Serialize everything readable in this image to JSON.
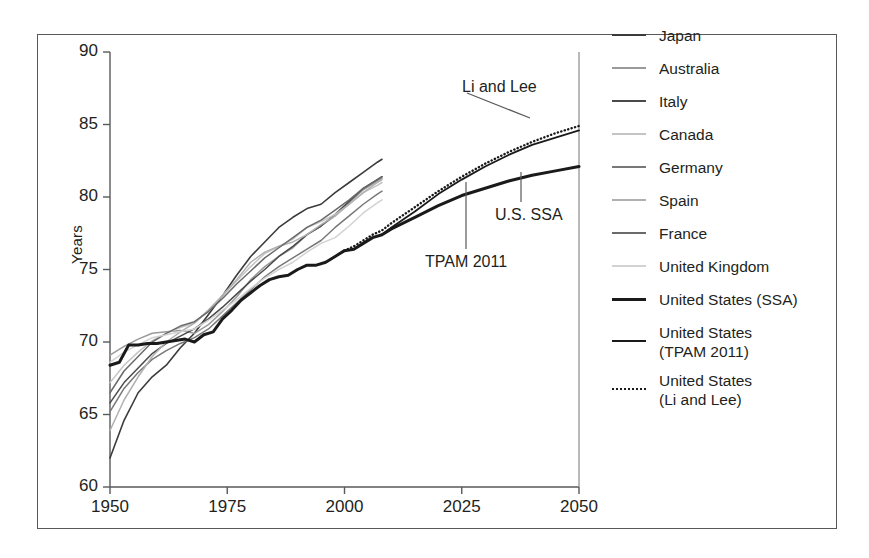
{
  "chart_data": {
    "type": "line",
    "title": "",
    "xlabel": "",
    "ylabel": "Years",
    "xlim": [
      1950,
      2050
    ],
    "ylim": [
      60,
      90
    ],
    "xticks": [
      1950,
      1975,
      2000,
      2025,
      2050
    ],
    "yticks": [
      60,
      65,
      70,
      75,
      80,
      85,
      90
    ],
    "grid": false,
    "legend_position": "right",
    "annotations": [
      {
        "text": "Li and Lee",
        "x": 2033,
        "y": 87.4
      },
      {
        "text": "TPAM 2011",
        "x": 2022,
        "y": 73.2
      },
      {
        "text": "U.S. SSA",
        "x": 2037,
        "y": 77.0
      }
    ],
    "series": [
      {
        "name": "Japan",
        "color": "#3b3b3b",
        "width": 1.6,
        "dash": "none",
        "x": [
          1950,
          1953,
          1956,
          1959,
          1962,
          1965,
          1968,
          1971,
          1974,
          1977,
          1980,
          1983,
          1986,
          1989,
          1992,
          1995,
          1998,
          2001,
          2004,
          2007,
          2008
        ],
        "values": [
          62.0,
          64.6,
          66.5,
          67.6,
          68.4,
          69.6,
          70.6,
          71.9,
          73.2,
          74.6,
          75.9,
          76.9,
          77.9,
          78.6,
          79.2,
          79.5,
          80.3,
          81.0,
          81.7,
          82.4,
          82.6
        ]
      },
      {
        "name": "Australia",
        "color": "#9a9a9a",
        "width": 1.5,
        "dash": "none",
        "x": [
          1950,
          1953,
          1956,
          1959,
          1962,
          1965,
          1968,
          1971,
          1974,
          1977,
          1980,
          1983,
          1986,
          1989,
          1992,
          1995,
          1998,
          2001,
          2004,
          2007,
          2008
        ],
        "values": [
          69.1,
          69.7,
          70.2,
          70.6,
          70.7,
          70.8,
          70.6,
          71.2,
          72.1,
          73.1,
          74.3,
          75.2,
          75.9,
          76.5,
          77.4,
          78.0,
          78.7,
          79.6,
          80.5,
          81.1,
          81.3
        ]
      },
      {
        "name": "Italy",
        "color": "#4a4a4a",
        "width": 1.5,
        "dash": "none",
        "x": [
          1950,
          1953,
          1956,
          1959,
          1962,
          1965,
          1968,
          1971,
          1974,
          1977,
          1980,
          1983,
          1986,
          1989,
          1992,
          1995,
          1998,
          2001,
          2004,
          2007,
          2008
        ],
        "values": [
          65.8,
          67.2,
          68.2,
          69.2,
          69.9,
          70.4,
          70.9,
          71.6,
          72.4,
          73.3,
          74.2,
          75.0,
          75.9,
          76.6,
          77.4,
          78.0,
          78.8,
          79.7,
          80.6,
          81.2,
          81.4
        ]
      },
      {
        "name": "Canada",
        "color": "#c4c4c4",
        "width": 1.5,
        "dash": "none",
        "x": [
          1950,
          1953,
          1956,
          1959,
          1962,
          1965,
          1968,
          1971,
          1974,
          1977,
          1980,
          1983,
          1986,
          1989,
          1992,
          1995,
          1998,
          2001,
          2004,
          2007,
          2008
        ],
        "values": [
          67.2,
          68.4,
          69.3,
          70.1,
          70.6,
          71.0,
          71.3,
          72.2,
          73.2,
          74.2,
          75.2,
          76.1,
          76.6,
          77.1,
          77.9,
          78.3,
          78.8,
          79.5,
          80.3,
          80.8,
          81.0
        ]
      },
      {
        "name": "Germany",
        "color": "#787878",
        "width": 1.5,
        "dash": "none",
        "x": [
          1950,
          1953,
          1956,
          1959,
          1962,
          1965,
          1968,
          1971,
          1974,
          1977,
          1980,
          1983,
          1986,
          1989,
          1992,
          1995,
          1998,
          2001,
          2004,
          2007,
          2008
        ],
        "values": [
          65.2,
          66.8,
          67.9,
          68.8,
          69.4,
          69.9,
          70.3,
          70.9,
          71.8,
          72.7,
          73.6,
          74.5,
          75.2,
          75.8,
          76.4,
          77.0,
          77.9,
          78.7,
          79.5,
          80.2,
          80.4
        ]
      },
      {
        "name": "Spain",
        "color": "#b0b0b0",
        "width": 1.5,
        "dash": "none",
        "x": [
          1950,
          1953,
          1956,
          1959,
          1962,
          1965,
          1968,
          1971,
          1974,
          1977,
          1980,
          1983,
          1986,
          1989,
          1992,
          1995,
          1998,
          2001,
          2004,
          2007,
          2008
        ],
        "values": [
          63.9,
          66.0,
          67.6,
          69.0,
          70.0,
          70.7,
          71.3,
          72.2,
          73.2,
          74.3,
          75.5,
          76.2,
          76.6,
          76.9,
          77.4,
          78.1,
          78.7,
          79.5,
          80.3,
          81.0,
          81.2
        ]
      },
      {
        "name": "France",
        "color": "#6a6a6a",
        "width": 1.5,
        "dash": "none",
        "x": [
          1950,
          1953,
          1956,
          1959,
          1962,
          1965,
          1968,
          1971,
          1974,
          1977,
          1980,
          1983,
          1986,
          1989,
          1992,
          1995,
          1998,
          2001,
          2004,
          2007,
          2008
        ],
        "values": [
          66.5,
          68.0,
          69.0,
          70.0,
          70.6,
          71.1,
          71.4,
          72.1,
          73.0,
          74.0,
          74.9,
          75.8,
          76.5,
          77.2,
          77.9,
          78.4,
          79.1,
          79.8,
          80.6,
          81.2,
          81.4
        ]
      },
      {
        "name": "United Kingdom",
        "color": "#d2d2d2",
        "width": 1.5,
        "dash": "none",
        "x": [
          1950,
          1953,
          1956,
          1959,
          1962,
          1965,
          1968,
          1971,
          1974,
          1977,
          1980,
          1983,
          1986,
          1989,
          1992,
          1995,
          1998,
          2001,
          2004,
          2007,
          2008
        ],
        "values": [
          68.6,
          69.3,
          69.8,
          70.3,
          70.5,
          70.7,
          70.9,
          71.5,
          72.2,
          72.9,
          73.7,
          74.4,
          75.0,
          75.5,
          76.2,
          76.8,
          77.2,
          78.0,
          78.9,
          79.6,
          79.8
        ]
      },
      {
        "name": "United States (SSA)",
        "color": "#1a1a1a",
        "width": 3.0,
        "dash": "none",
        "x": [
          1950,
          1952,
          1954,
          1956,
          1958,
          1960,
          1962,
          1964,
          1966,
          1968,
          1970,
          1972,
          1974,
          1976,
          1978,
          1980,
          1982,
          1984,
          1986,
          1988,
          1990,
          1992,
          1994,
          1996,
          1998,
          2000,
          2002,
          2004,
          2006,
          2008,
          2010,
          2015,
          2020,
          2025,
          2030,
          2035,
          2040,
          2045,
          2050
        ],
        "values": [
          68.4,
          68.6,
          69.8,
          69.8,
          69.9,
          69.9,
          70.0,
          70.1,
          70.2,
          70.0,
          70.5,
          70.7,
          71.6,
          72.2,
          72.9,
          73.4,
          73.9,
          74.3,
          74.5,
          74.6,
          75.0,
          75.3,
          75.3,
          75.5,
          75.9,
          76.3,
          76.4,
          76.8,
          77.2,
          77.4,
          77.8,
          78.6,
          79.4,
          80.1,
          80.6,
          81.1,
          81.5,
          81.8,
          82.1
        ]
      },
      {
        "name": "United States (TPAM 2011)",
        "color": "#1a1a1a",
        "width": 1.8,
        "dash": "none",
        "x": [
          2008,
          2010,
          2015,
          2020,
          2025,
          2030,
          2035,
          2040,
          2045,
          2050
        ],
        "values": [
          77.4,
          77.9,
          79.0,
          80.2,
          81.2,
          82.1,
          82.9,
          83.6,
          84.1,
          84.6
        ]
      },
      {
        "name": "United States (Li and Lee)",
        "color": "#1a1a1a",
        "width": 2.4,
        "dash": "dotted",
        "x": [
          2000,
          2002,
          2004,
          2006,
          2008,
          2010,
          2015,
          2020,
          2025,
          2030,
          2035,
          2040,
          2045,
          2050
        ],
        "values": [
          76.3,
          76.6,
          77.0,
          77.4,
          77.7,
          78.2,
          79.3,
          80.4,
          81.4,
          82.3,
          83.1,
          83.8,
          84.4,
          84.9
        ]
      }
    ]
  },
  "axes": {
    "y_label": "Years",
    "y_tick_labels": [
      "90",
      "85",
      "80",
      "75",
      "70",
      "65",
      "60"
    ],
    "x_tick_labels": [
      "1950",
      "1975",
      "2000",
      "2025",
      "2050"
    ]
  },
  "annotations": {
    "li_and_lee": "Li and Lee",
    "tpam_2011": "TPAM 2011",
    "us_ssa": "U.S. SSA"
  },
  "legend": {
    "items": [
      {
        "label": "Japan",
        "label2": "",
        "color": "#3b3b3b",
        "width": 1.8,
        "dash": "none"
      },
      {
        "label": "Australia",
        "label2": "",
        "color": "#9a9a9a",
        "width": 1.6,
        "dash": "none"
      },
      {
        "label": "Italy",
        "label2": "",
        "color": "#4a4a4a",
        "width": 1.8,
        "dash": "none"
      },
      {
        "label": "Canada",
        "label2": "",
        "color": "#c4c4c4",
        "width": 1.6,
        "dash": "none"
      },
      {
        "label": "Germany",
        "label2": "",
        "color": "#787878",
        "width": 1.7,
        "dash": "none"
      },
      {
        "label": "Spain",
        "label2": "",
        "color": "#b0b0b0",
        "width": 1.6,
        "dash": "none"
      },
      {
        "label": "France",
        "label2": "",
        "color": "#6a6a6a",
        "width": 1.7,
        "dash": "none"
      },
      {
        "label": "United Kingdom",
        "label2": "",
        "color": "#d2d2d2",
        "width": 1.6,
        "dash": "none"
      },
      {
        "label": "United States (SSA)",
        "label2": "",
        "color": "#1a1a1a",
        "width": 3.2,
        "dash": "none"
      },
      {
        "label": "United States",
        "label2": "(TPAM 2011)",
        "color": "#1a1a1a",
        "width": 2.4,
        "dash": "none"
      },
      {
        "label": "United States",
        "label2": "(Li and Lee)",
        "color": "#1a1a1a",
        "width": 2.2,
        "dash": "dotted"
      }
    ]
  }
}
